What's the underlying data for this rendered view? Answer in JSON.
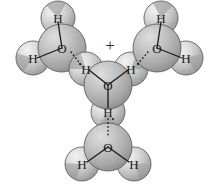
{
  "figure": {
    "background_color": "#ffffff",
    "charge_label": "+",
    "atom_labels": {
      "oxygen": "O",
      "hydrogen": "H"
    },
    "colors": {
      "sphere_light": "#e6e6e6",
      "sphere_mid": "#c8c8c8",
      "sphere_dark": "#9a9a9a",
      "sphere_outline": "#5a5a5a",
      "bond_line": "#1a1a1a",
      "label_text": "#1a1a1a"
    }
  },
  "molecules": [
    {
      "id": "water-top-left",
      "name": "water molecule top left",
      "formula": "H2O",
      "oxygen": {
        "label": "O",
        "x": 62,
        "y": 48,
        "r": 24
      },
      "hydrogens": [
        {
          "label": "H",
          "x": 58,
          "y": 18,
          "r": 17
        },
        {
          "label": "H",
          "x": 33,
          "y": 58,
          "r": 17
        }
      ]
    },
    {
      "id": "hydronium-center",
      "name": "hydronium ion center",
      "formula": "H3O+",
      "charge": "+",
      "charge_x": 110,
      "charge_y": 45,
      "oxygen": {
        "label": "O",
        "x": 108,
        "y": 85,
        "r": 24
      },
      "hydrogens": [
        {
          "label": "H",
          "x": 86,
          "y": 69,
          "r": 17
        },
        {
          "label": "H",
          "x": 131,
          "y": 69,
          "r": 17
        },
        {
          "label": "H",
          "x": 108,
          "y": 112,
          "r": 17
        }
      ]
    },
    {
      "id": "water-top-right",
      "name": "water molecule top right",
      "formula": "H2O",
      "oxygen": {
        "label": "O",
        "x": 157,
        "y": 48,
        "r": 24
      },
      "hydrogens": [
        {
          "label": "H",
          "x": 161,
          "y": 18,
          "r": 17
        },
        {
          "label": "H",
          "x": 186,
          "y": 58,
          "r": 17
        }
      ]
    },
    {
      "id": "water-bottom",
      "name": "water molecule bottom",
      "formula": "H2O",
      "oxygen": {
        "label": "O",
        "x": 108,
        "y": 147,
        "r": 24
      },
      "hydrogens": [
        {
          "label": "H",
          "x": 82,
          "y": 164,
          "r": 17
        },
        {
          "label": "H",
          "x": 134,
          "y": 164,
          "r": 17
        }
      ]
    }
  ],
  "covalent_bonds": [
    {
      "name": "bond-tl-o-h-top",
      "x1": 62,
      "y1": 48,
      "x2": 58,
      "y2": 22
    },
    {
      "name": "bond-tl-o-h-left",
      "x1": 62,
      "y1": 48,
      "x2": 37,
      "y2": 58
    },
    {
      "name": "bond-c-o-h-left",
      "x1": 108,
      "y1": 85,
      "x2": 89,
      "y2": 70
    },
    {
      "name": "bond-c-o-h-right",
      "x1": 108,
      "y1": 85,
      "x2": 128,
      "y2": 70
    },
    {
      "name": "bond-c-o-h-bottom",
      "x1": 108,
      "y1": 85,
      "x2": 108,
      "y2": 108
    },
    {
      "name": "bond-tr-o-h-top",
      "x1": 157,
      "y1": 48,
      "x2": 161,
      "y2": 22
    },
    {
      "name": "bond-tr-o-h-right",
      "x1": 157,
      "y1": 48,
      "x2": 182,
      "y2": 58
    },
    {
      "name": "bond-b-o-h-left",
      "x1": 108,
      "y1": 147,
      "x2": 87,
      "y2": 162
    },
    {
      "name": "bond-b-o-h-right",
      "x1": 108,
      "y1": 147,
      "x2": 129,
      "y2": 162
    }
  ],
  "hydrogen_bonds": [
    {
      "name": "hbond-left",
      "x1": 71,
      "y1": 52,
      "x2": 82,
      "y2": 66
    },
    {
      "name": "hbond-right",
      "x1": 148,
      "y1": 52,
      "x2": 136,
      "y2": 66
    },
    {
      "name": "hbond-bottom",
      "x1": 108,
      "y1": 119,
      "x2": 108,
      "y2": 137
    }
  ],
  "charge_dots": [
    {
      "name": "dot-h-left",
      "x": 80,
      "y": 64
    },
    {
      "name": "dot-h-right",
      "x": 138,
      "y": 64
    },
    {
      "name": "dot-h-bottom",
      "x": 113,
      "y": 119
    }
  ]
}
